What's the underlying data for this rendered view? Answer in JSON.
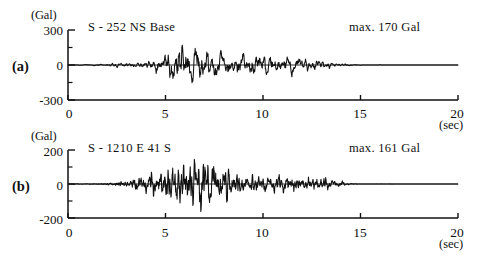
{
  "figure": {
    "background_color": "#ffffff",
    "ink_color": "#111111"
  },
  "panels": [
    {
      "letter": "(a)",
      "unit": "(Gal)",
      "trace_title": "S  - 252 NS Base",
      "max_label": "max. 170 Gal",
      "x_axis_unit": "(sec)",
      "y_ticks": [
        "300",
        "0",
        "-300"
      ],
      "x_ticks": [
        "0",
        "5",
        "10",
        "15",
        "20"
      ]
    },
    {
      "letter": "(b)",
      "unit": "(Gal)",
      "trace_title": "S - 1210 E 41 S",
      "max_label": "max. 161 Gal",
      "x_axis_unit": "(sec)",
      "y_ticks": [
        "200",
        "0",
        "-200"
      ],
      "x_ticks": [
        "0",
        "5",
        "10",
        "15",
        "20"
      ]
    }
  ],
  "chart_data": [
    {
      "type": "line",
      "title": "S  - 252 NS Base",
      "annotation": "max. 170 Gal",
      "panel_label": "(a)",
      "xlabel": "(sec)",
      "ylabel": "(Gal)",
      "xlim": [
        0,
        20
      ],
      "ylim": [
        -300,
        300
      ],
      "xticks": [
        0,
        5,
        10,
        15,
        20
      ],
      "yticks": [
        -300,
        0,
        300
      ],
      "yticks_minor": [
        -150,
        150
      ],
      "grid": false,
      "legend": "none",
      "max_abs_value": 170,
      "units": "Gal",
      "duration_sec": 20,
      "signal_onset_sec": 2.0,
      "signal_peak_sec": 5.8,
      "signal_end_sec": 14.6,
      "sampling_dt": 0.02,
      "envelope_description": "Quiescent until ~2 s, gradual growth to a sharp maximum of 170 Gal near 5.8 s, sustained moderate shaking to ~11 s, then exponential decay to flat baseline by ~14.6 s.",
      "envelope_nodes": {
        "t": [
          0.0,
          1.0,
          2.0,
          2.6,
          3.2,
          3.8,
          4.2,
          4.6,
          5.0,
          5.4,
          5.8,
          6.2,
          6.6,
          7.0,
          7.6,
          8.2,
          8.8,
          9.4,
          10.0,
          10.6,
          11.2,
          11.8,
          12.4,
          13.0,
          13.6,
          14.2,
          14.6,
          15.2,
          20.0
        ],
        "amp": [
          1,
          3,
          8,
          14,
          20,
          26,
          40,
          62,
          95,
          130,
          170,
          140,
          120,
          112,
          100,
          92,
          98,
          88,
          78,
          82,
          70,
          58,
          44,
          34,
          22,
          10,
          4,
          1,
          0
        ]
      },
      "dominant_period_sec": 0.36
    },
    {
      "type": "line",
      "title": "S - 1210 E 41 S",
      "annotation": "max. 161 Gal",
      "panel_label": "(b)",
      "xlabel": "(sec)",
      "ylabel": "(Gal)",
      "xlim": [
        0,
        20
      ],
      "ylim": [
        -200,
        200
      ],
      "xticks": [
        0,
        5,
        10,
        15,
        20
      ],
      "yticks": [
        -200,
        0,
        200
      ],
      "yticks_minor": [
        -100,
        100
      ],
      "grid": false,
      "legend": "none",
      "max_abs_value": 161,
      "units": "Gal",
      "duration_sec": 20,
      "signal_onset_sec": 2.2,
      "signal_peak_sec": 6.9,
      "signal_end_sec": 14.4,
      "sampling_dt": 0.015,
      "envelope_description": "Higher-frequency record; onset ~2.2 s, strong irregular shaking from 4 to 8 s with maximum 161 Gal near 6.9 s, then steady tapering with persistent small oscillations until ~14.4 s.",
      "envelope_nodes": {
        "t": [
          0.0,
          1.2,
          2.2,
          2.8,
          3.4,
          4.0,
          4.4,
          4.8,
          5.2,
          5.6,
          6.0,
          6.4,
          6.9,
          7.3,
          7.7,
          8.1,
          8.6,
          9.2,
          9.8,
          10.4,
          11.0,
          11.6,
          12.2,
          12.8,
          13.4,
          13.9,
          14.4,
          15.0,
          20.0
        ],
        "amp": [
          1,
          2,
          8,
          18,
          30,
          52,
          70,
          96,
          120,
          138,
          126,
          144,
          161,
          128,
          110,
          118,
          86,
          62,
          54,
          50,
          56,
          48,
          52,
          44,
          32,
          16,
          5,
          1,
          0
        ]
      },
      "dominant_period_sec": 0.18
    }
  ]
}
